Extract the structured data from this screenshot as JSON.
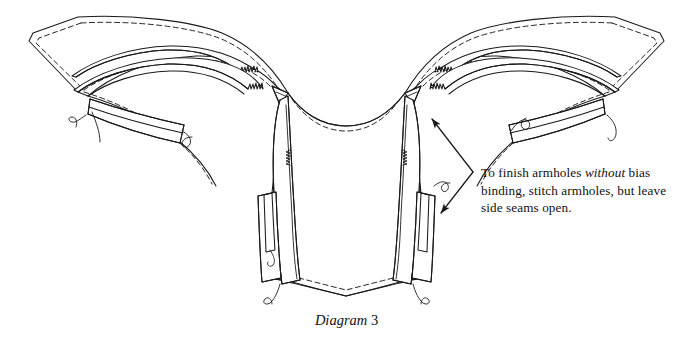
{
  "figure": {
    "title": "Diagram 3",
    "caption_label": "Diagram",
    "caption_number": "3",
    "line_color": "#1a1a1a",
    "background_color": "#ffffff",
    "fill_color": "#ffffff"
  },
  "annotation": {
    "line1_pre": "To finish armholes ",
    "line1_italic": "without",
    "line1_post": " bias",
    "line2": "binding, stitch armholes, but leave",
    "line3": "side seams open.",
    "full_text": "To finish armholes without bias binding, stitch armholes, but leave side seams open.",
    "arrow_upper_target": "right-armhole-edge",
    "arrow_lower_target": "right-side-seam",
    "leader_style": "double-headed-bent-leader"
  },
  "parts": [
    {
      "name": "left-wing-panel",
      "detail": "outer sleeve wing with dashed stitch line"
    },
    {
      "name": "right-wing-panel",
      "detail": "outer sleeve wing with dashed stitch line"
    },
    {
      "name": "left-notched-seam-allowance",
      "detail": "clipped curved seam allowance"
    },
    {
      "name": "right-notched-seam-allowance",
      "detail": "clipped curved seam allowance"
    },
    {
      "name": "left-cuff-band",
      "detail": "curved band with thread tails"
    },
    {
      "name": "right-cuff-band",
      "detail": "curved band with thread tails"
    },
    {
      "name": "center-front-bodice",
      "detail": "neckline curve with dashed stitching and V hem point"
    },
    {
      "name": "left-shoulder-strap",
      "detail": "narrow band"
    },
    {
      "name": "right-shoulder-strap",
      "detail": "narrow band"
    },
    {
      "name": "left-side-panel",
      "detail": "boning channel and notched armhole edge"
    },
    {
      "name": "right-side-panel",
      "detail": "boning channel and notched armhole edge"
    }
  ]
}
